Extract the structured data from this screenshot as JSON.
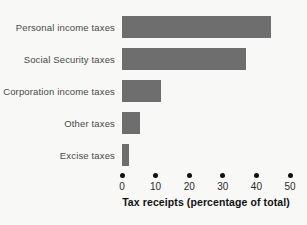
{
  "chart_data": {
    "type": "bar",
    "orientation": "horizontal",
    "title": "",
    "xlabel": "Tax receipts (percentage of total)",
    "ylabel": "",
    "categories": [
      "Personal income taxes",
      "Social Security taxes",
      "Corporation income taxes",
      "Other taxes",
      "Excise taxes"
    ],
    "values": [
      44.3,
      36.9,
      11.7,
      5.5,
      2.0
    ],
    "xlim": [
      0,
      50
    ],
    "xticks": [
      0,
      10,
      20,
      30,
      40,
      50
    ],
    "xtick_labels": [
      "0",
      "10",
      "20",
      "30",
      "40",
      "50"
    ],
    "grid": false,
    "legend": false,
    "bar_color": "#6e6e6e",
    "background_color": "#f8f8f6",
    "tick_marker": "dot"
  }
}
